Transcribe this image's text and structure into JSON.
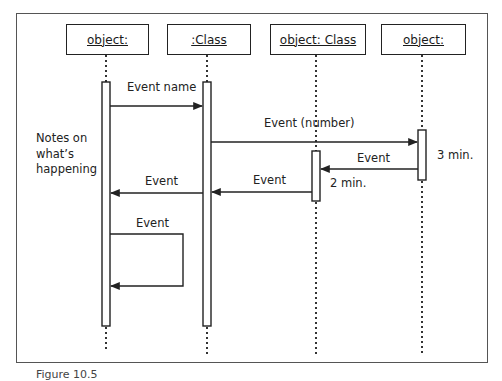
{
  "diagram": {
    "type": "uml-sequence-diagram",
    "objects": [
      {
        "label": "object:",
        "lifeline_x": 106
      },
      {
        "label": ":Class",
        "lifeline_x": 207
      },
      {
        "label": "object: Class",
        "lifeline_x": 316
      },
      {
        "label": "object:",
        "lifeline_x": 422
      }
    ],
    "notes": {
      "line1": "Notes on",
      "line2": "what’s",
      "line3": "happening"
    },
    "messages": [
      {
        "label": "Event name",
        "from": 0,
        "to": 1
      },
      {
        "label": "Event (number)",
        "from": 1,
        "to": 3
      },
      {
        "label": "Event",
        "from": 3,
        "to": 2
      },
      {
        "label": "Event",
        "from": 2,
        "to": 1
      },
      {
        "label": "Event",
        "from": 1,
        "to": 0
      },
      {
        "label": "Event",
        "from": 0,
        "to": 0,
        "self": true
      }
    ],
    "durations": [
      {
        "label": "3 min.",
        "object": 3
      },
      {
        "label": "2 min.",
        "object": 2
      }
    ],
    "caption": "Figure 10.5"
  }
}
